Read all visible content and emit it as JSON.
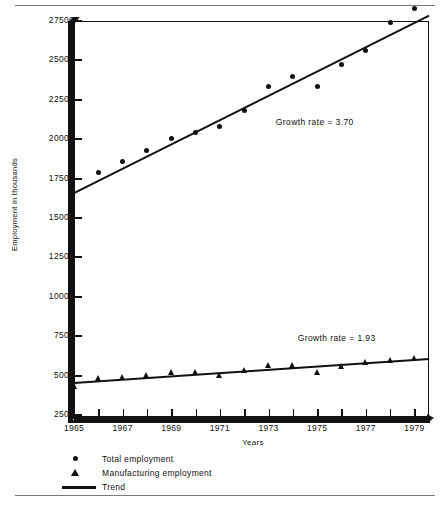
{
  "figure": {
    "yaxis_title": "Employment in thousands",
    "xaxis_title": "Years"
  },
  "annotations": {
    "total": "Growth rate  =  3.70",
    "manufacturing": "Growth rate  =  1.93"
  },
  "legend": {
    "items": [
      {
        "key": "circle-marker",
        "label": "Total employment"
      },
      {
        "key": "triangle-marker",
        "label": "Manufacturing employment"
      },
      {
        "key": "line-marker",
        "label": "Trend"
      }
    ]
  },
  "chart_data": {
    "type": "scatter",
    "title": "",
    "subtitle": "",
    "xlabel": "Years",
    "ylabel": "Employment in thousands",
    "xlim": [
      1965,
      1979.6
    ],
    "ylim": [
      2500,
      27500
    ],
    "grid": false,
    "legend_position": "below-axes-left",
    "y_ticks": [
      2500,
      5000,
      7500,
      10000,
      12500,
      15000,
      17500,
      20000,
      22500,
      25000,
      27500
    ],
    "x_ticks": [
      1965,
      1966,
      1967,
      1968,
      1969,
      1970,
      1971,
      1972,
      1973,
      1974,
      1975,
      1976,
      1977,
      1978,
      1979
    ],
    "x_tick_labels": [
      "1965",
      "",
      "1967",
      "",
      "1969",
      "",
      "1971",
      "",
      "1973",
      "",
      "1975",
      "",
      "1977",
      "",
      "1979"
    ],
    "x": [
      1965,
      1966,
      1967,
      1968,
      1969,
      1970,
      1971,
      1972,
      1973,
      1974,
      1975,
      1976,
      1977,
      1978,
      1979
    ],
    "series": [
      {
        "name": "Total employment",
        "marker": "circle",
        "values": [
          null,
          17900,
          18600,
          19300,
          20050,
          20400,
          20800,
          21800,
          23350,
          23950,
          23350,
          24750,
          25650,
          27400,
          28300
        ]
      },
      {
        "name": "Manufacturing employment",
        "marker": "triangle",
        "values": [
          4350,
          4850,
          4900,
          5050,
          5250,
          5200,
          5050,
          5350,
          5650,
          5650,
          5200,
          5600,
          5850,
          6000,
          6100
        ]
      }
    ],
    "trends": [
      {
        "name": "Trend (total employment)",
        "growth_rate": 3.7,
        "start": {
          "x": 1965,
          "y": 16650
        },
        "end": {
          "x": 1979.6,
          "y": 27900
        }
      },
      {
        "name": "Trend (manufacturing employment)",
        "growth_rate": 1.93,
        "start": {
          "x": 1965,
          "y": 4580
        },
        "end": {
          "x": 1979.6,
          "y": 6100
        }
      }
    ]
  }
}
